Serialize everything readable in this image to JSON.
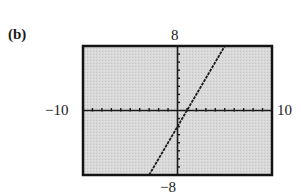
{
  "panel_label": "(b)",
  "window": {
    "xmin_label": "−10",
    "xmax_label": "10",
    "ymin_label": "−8",
    "ymax_label": "8"
  },
  "colors": {
    "background": "#d6d6d6",
    "frame": "#141414",
    "axes": "#1a1a1a",
    "line": "#1a1a1a"
  },
  "chart_data": {
    "type": "line",
    "title": "(b)",
    "xlabel": "",
    "ylabel": "",
    "xlim": [
      -10,
      10
    ],
    "ylim": [
      -8,
      8
    ],
    "xscale_tick": 1,
    "yscale_tick": 1,
    "grid": false,
    "legend": null,
    "tick_labels": {
      "x": [
        "−10",
        "10"
      ],
      "y": [
        "−8",
        "8"
      ]
    },
    "series": [
      {
        "name": "y = 2x − 2",
        "style": "dashed-pixel",
        "x": [
          -3,
          0,
          1,
          5
        ],
        "y": [
          -8,
          -2,
          0,
          8
        ]
      }
    ]
  }
}
